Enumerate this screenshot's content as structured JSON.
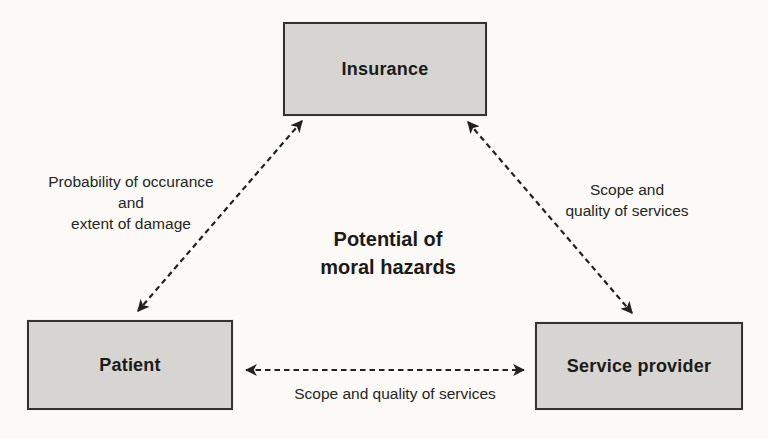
{
  "figure": {
    "nodes": {
      "insurance": {
        "label": "Insurance"
      },
      "patient": {
        "label": "Patient"
      },
      "service_provider": {
        "label": "Service provider"
      }
    },
    "center_caption": {
      "line1": "Potential of",
      "line2": "moral hazards"
    },
    "edge_labels": {
      "insurance_patient": {
        "line1": "Probability of occurance",
        "line2": "and",
        "line3": "extent of damage"
      },
      "insurance_service_provider": {
        "line1": "Scope and",
        "line2": "quality of services"
      },
      "patient_service_provider": {
        "line1": "Scope and quality of services"
      }
    },
    "colors": {
      "background": "#fbfaf7",
      "box_fill": "#d6d5d2",
      "box_border": "#33332f",
      "arrow": "#21211f",
      "text": "#1b1b18"
    }
  }
}
